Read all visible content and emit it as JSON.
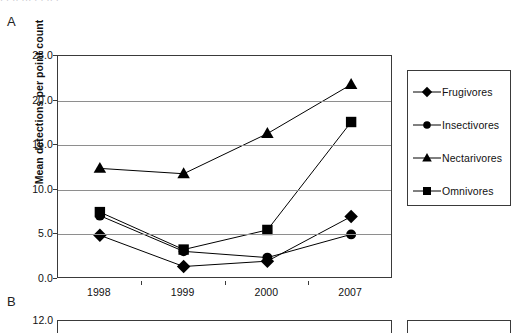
{
  "figure": {
    "panel_a_letter": "A",
    "panel_b_letter": "B",
    "clipped_caption_artifact": "· · ·· ··· · · ·· ·"
  },
  "chart_data": {
    "type": "line",
    "title": "",
    "subtitle": "",
    "xlabel": "",
    "ylabel": "Mean detections per point count",
    "categories": [
      "1998",
      "1999",
      "2000",
      "2007"
    ],
    "ylim": [
      0.0,
      25.0
    ],
    "ytick_step": 5.0,
    "yticks": [
      "0.0",
      "5.0",
      "10.0",
      "15.0",
      "20.0",
      "25.0"
    ],
    "grid": "horizontal",
    "legend_position": "right-outside",
    "series": [
      {
        "name": "Frugivores",
        "marker": "diamond",
        "values": [
          4.9,
          1.4,
          2.0,
          7.0
        ]
      },
      {
        "name": "Insectivores",
        "marker": "circle",
        "values": [
          7.1,
          3.1,
          2.4,
          5.0
        ]
      },
      {
        "name": "Nectarivores",
        "marker": "triangle",
        "values": [
          12.4,
          11.8,
          16.3,
          21.8
        ]
      },
      {
        "name": "Omnivores",
        "marker": "square",
        "values": [
          7.5,
          3.3,
          5.5,
          17.6
        ]
      }
    ],
    "series_color": "#000000"
  },
  "chart_b_partial": {
    "type": "line",
    "ylim_top_label": "12.0",
    "note_visible_portion": "top gridline and legend box only"
  },
  "legend": {
    "items": [
      {
        "label": "Frugivores",
        "marker": "diamond-marker"
      },
      {
        "label": "Insectivores",
        "marker": "circle-marker"
      },
      {
        "label": "Nectarivores",
        "marker": "triangle-marker"
      },
      {
        "label": "Omnivores",
        "marker": "square-marker"
      }
    ]
  }
}
